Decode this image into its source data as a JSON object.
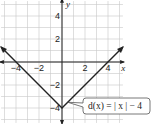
{
  "chart_data": {
    "type": "line",
    "title": "",
    "xlabel": "x",
    "ylabel": "y",
    "xlim": [
      -5,
      5
    ],
    "ylim": [
      -5,
      5
    ],
    "grid": true,
    "x_ticks": [
      -4,
      -2,
      2,
      4
    ],
    "x_tick_labels": [
      "−4",
      "−2",
      "2",
      "4"
    ],
    "y_ticks": [
      4,
      2,
      -2,
      -4
    ],
    "y_tick_labels": [
      "4",
      "2",
      "−2",
      "−4"
    ],
    "series": [
      {
        "name": "d(x) = |x| − 4",
        "x": [
          -5.3,
          0,
          5.3
        ],
        "y": [
          1.3,
          -4,
          1.3
        ],
        "color": "#222222",
        "arrows": true
      }
    ],
    "annotation": {
      "text": "d(x) = | x | − 4",
      "points_to": [
        0.5,
        -3.5
      ]
    }
  }
}
